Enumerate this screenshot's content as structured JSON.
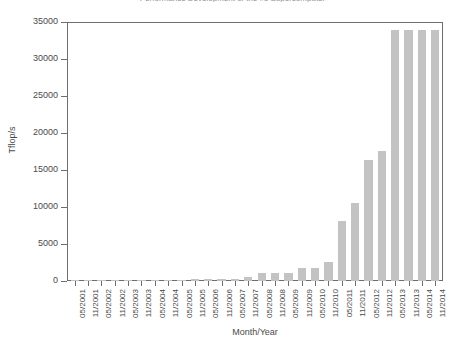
{
  "chart_data": {
    "type": "bar",
    "title": "Performance Development of the #1 Supercomputer",
    "xlabel": "Month/Year",
    "ylabel": "Tflop/s",
    "ylim": [
      0,
      35000
    ],
    "ytick_labels": [
      "0",
      "5000",
      "10000",
      "15000",
      "20000",
      "25000",
      "30000",
      "35000"
    ],
    "ytick_values": [
      0,
      5000,
      10000,
      15000,
      20000,
      25000,
      30000,
      35000
    ],
    "grid": false,
    "legend": null,
    "bar_color": "#c3c3c3",
    "axis_color": "#6e6e6e",
    "categories": [
      "05/2001",
      "11/2001",
      "05/2002",
      "11/2002",
      "05/2003",
      "11/2003",
      "05/2004",
      "11/2004",
      "05/2005",
      "11/2005",
      "05/2006",
      "11/2006",
      "05/2007",
      "11/2007",
      "05/2008",
      "11/2008",
      "05/2009",
      "11/2009",
      "05/2010",
      "11/2010",
      "05/2011",
      "11/2011",
      "05/2012",
      "11/2012",
      "05/2013",
      "11/2013",
      "05/2014",
      "11/2014"
    ],
    "values": [
      7,
      7,
      36,
      36,
      36,
      36,
      36,
      70,
      136,
      281,
      281,
      281,
      281,
      478,
      1026,
      1105,
      1105,
      1759,
      1759,
      2566,
      8162,
      10510,
      16325,
      17590,
      33863,
      33863,
      33863,
      33863
    ]
  }
}
